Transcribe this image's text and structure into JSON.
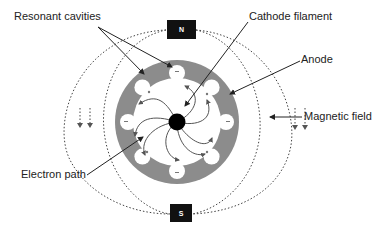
{
  "diagram": {
    "labels": {
      "resonant_cavities": "Resonant cavities",
      "cathode_filament": "Cathode filament",
      "anode": "Anode",
      "magnetic_field": "Magnetic field",
      "electron_path": "Electron path"
    },
    "poles": {
      "north": "N",
      "south": "S"
    },
    "colors": {
      "anode_gray": "#8c8c8c",
      "cathode_black": "#000000",
      "line": "#333333",
      "pole_box": "#111111"
    }
  }
}
